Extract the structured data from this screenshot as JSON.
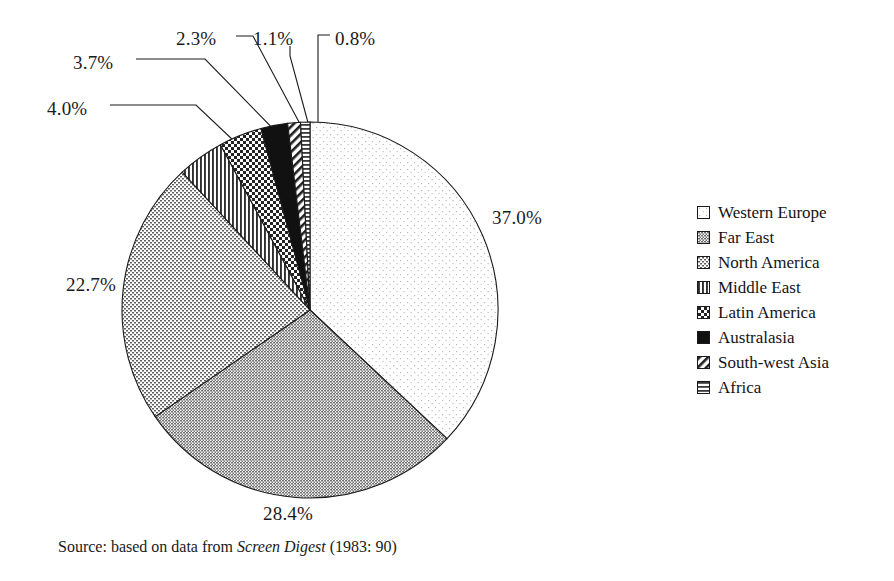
{
  "chart_data": {
    "type": "pie",
    "title": "",
    "categories": [
      "Western Europe",
      "Far East",
      "North America",
      "Middle East",
      "Latin America",
      "Australasia",
      "South-west Asia",
      "Africa"
    ],
    "values": [
      37.0,
      28.4,
      22.7,
      4.0,
      3.7,
      2.3,
      1.1,
      0.8
    ],
    "value_labels": [
      "37.0%",
      "28.4%",
      "22.7%",
      "4.0%",
      "3.7%",
      "2.3%",
      "1.1%",
      "0.8%"
    ],
    "units": "percent",
    "start_angle_deg": 0,
    "direction": "clockwise",
    "legend_position": "right",
    "grid": false,
    "patterns": [
      "blank",
      "fine-dots-gray",
      "checkerboard-grid",
      "vertical-stripes",
      "coarse-checkerboard",
      "solid-black",
      "diagonal-stripes",
      "horizontal-stripes"
    ]
  },
  "labels": [
    {
      "text": "4.0%",
      "x": 47,
      "y": 98
    },
    {
      "text": "3.7%",
      "x": 73,
      "y": 52
    },
    {
      "text": "2.3%",
      "x": 176,
      "y": 28
    },
    {
      "text": "1.1%",
      "x": 253,
      "y": 28
    },
    {
      "text": "0.8%",
      "x": 335,
      "y": 28
    },
    {
      "text": "37.0%",
      "x": 492,
      "y": 207
    },
    {
      "text": "22.7%",
      "x": 66,
      "y": 274
    },
    {
      "text": "28.4%",
      "x": 263,
      "y": 503
    }
  ],
  "legend": {
    "items": [
      {
        "label": "Western Europe",
        "pattern": "blank"
      },
      {
        "label": "Far East",
        "pattern": "fine-dots-gray"
      },
      {
        "label": "North America",
        "pattern": "checkerboard-grid"
      },
      {
        "label": "Middle East",
        "pattern": "vertical-stripes"
      },
      {
        "label": "Latin America",
        "pattern": "coarse-checkerboard"
      },
      {
        "label": "Australasia",
        "pattern": "solid-black"
      },
      {
        "label": "South-west Asia",
        "pattern": "diagonal-stripes"
      },
      {
        "label": "Africa",
        "pattern": "horizontal-stripes"
      }
    ]
  },
  "source": {
    "prefix": "Source: based on data from ",
    "italic": "Screen Digest",
    "suffix": " (1983: 90)"
  },
  "colors": {
    "stroke": "#1a1a1a",
    "text": "#1a1a1a",
    "background": "#ffffff",
    "western_europe_fill": "#fafafa",
    "far_east_fill": "#8f8f8f",
    "north_america_fill": "#b5b5b5",
    "australasia_fill": "#111111"
  },
  "geometry": {
    "cx": 310,
    "cy": 310,
    "r": 188
  }
}
